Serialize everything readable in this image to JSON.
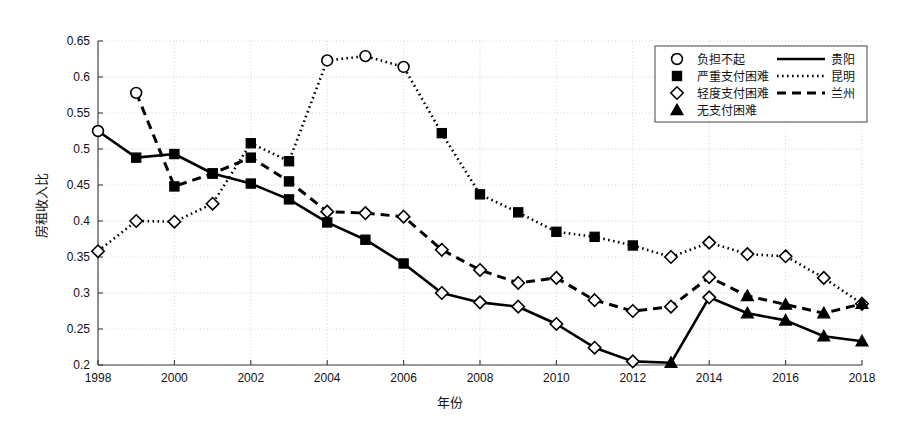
{
  "chart_data": {
    "type": "line",
    "title": "",
    "xlabel": "年份",
    "ylabel": "房租收入比",
    "xlim": [
      1998,
      2018
    ],
    "ylim": [
      0.2,
      0.65
    ],
    "xticks": [
      1998,
      2000,
      2002,
      2004,
      2006,
      2008,
      2010,
      2012,
      2014,
      2016,
      2018
    ],
    "yticks": [
      0.2,
      0.25,
      0.3,
      0.35,
      0.4,
      0.45,
      0.5,
      0.55,
      0.6,
      0.65
    ],
    "grid": true,
    "legend_position": "top-right",
    "x": [
      1998,
      1999,
      2000,
      2001,
      2002,
      2003,
      2004,
      2005,
      2006,
      2007,
      2008,
      2009,
      2010,
      2011,
      2012,
      2013,
      2014,
      2015,
      2016,
      2017,
      2018
    ],
    "series": [
      {
        "name": "贵阳",
        "line_style": "solid",
        "values": [
          0.525,
          0.488,
          0.493,
          0.466,
          0.452,
          0.43,
          0.398,
          0.374,
          0.341,
          0.3,
          0.287,
          0.281,
          0.257,
          0.224,
          0.205,
          0.203,
          0.294,
          0.272,
          0.262,
          0.24,
          0.233
        ],
        "markers": [
          "circle",
          "square",
          "square",
          "square",
          "square",
          "square",
          "square",
          "square",
          "square",
          "diamond",
          "diamond",
          "diamond",
          "diamond",
          "diamond",
          "diamond",
          "triangle",
          "diamond",
          "triangle",
          "triangle",
          "triangle",
          "triangle"
        ]
      },
      {
        "name": "昆明",
        "line_style": "dotted",
        "values": [
          0.358,
          0.4,
          0.399,
          0.424,
          0.508,
          0.483,
          0.623,
          0.629,
          0.614,
          0.522,
          0.437,
          0.412,
          0.385,
          0.378,
          0.366,
          0.35,
          0.37,
          0.354,
          0.351,
          0.321,
          0.285
        ],
        "markers": [
          "diamond",
          "diamond",
          "diamond",
          "diamond",
          "square",
          "square",
          "circle",
          "circle",
          "circle",
          "square",
          "square",
          "square",
          "square",
          "square",
          "square",
          "diamond",
          "diamond",
          "diamond",
          "diamond",
          "diamond",
          "diamond"
        ]
      },
      {
        "name": "兰州",
        "line_style": "dashed",
        "values": [
          null,
          0.578,
          0.448,
          0.466,
          0.488,
          0.455,
          0.413,
          0.411,
          0.406,
          0.36,
          0.332,
          0.314,
          0.321,
          0.29,
          0.275,
          0.281,
          0.322,
          0.296,
          0.284,
          0.272,
          0.285
        ],
        "markers": [
          null,
          "circle",
          "square",
          "square",
          "square",
          "square",
          "diamond",
          "diamond",
          "diamond",
          "diamond",
          "diamond",
          "diamond",
          "diamond",
          "diamond",
          "diamond",
          "diamond",
          "diamond",
          "triangle",
          "triangle",
          "triangle",
          "triangle"
        ]
      }
    ],
    "marker_legend": [
      {
        "marker": "circle",
        "label": "负担不起"
      },
      {
        "marker": "square",
        "label": "严重支付困难"
      },
      {
        "marker": "diamond",
        "label": "轻度支付困难"
      },
      {
        "marker": "triangle",
        "label": "无支付困难"
      }
    ],
    "line_legend": [
      {
        "line_style": "solid",
        "label": "贵阳"
      },
      {
        "line_style": "dotted",
        "label": "昆明"
      },
      {
        "line_style": "dashed",
        "label": "兰州"
      }
    ],
    "colors": {
      "ink": "#000000",
      "grid": "#bfbfbf",
      "axis": "#444444",
      "background": "#ffffff"
    }
  }
}
